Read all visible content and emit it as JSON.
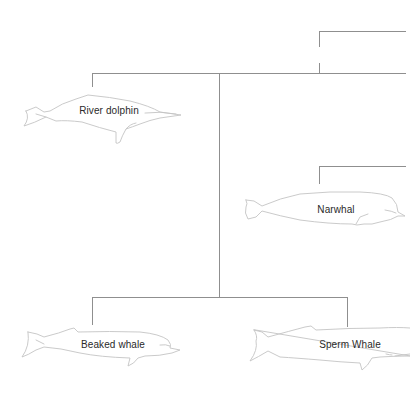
{
  "diagram": {
    "type": "phylogenetic-tree",
    "line_color": "#8f8f8f",
    "outline_color": "#c4c4c4",
    "text_color": "#2a2a2a",
    "taxa": [
      {
        "id": "river-dolphin",
        "label": "River dolphin",
        "label_x": 109,
        "label_y": 111
      },
      {
        "id": "narwhal",
        "label": "Narwhal",
        "label_x": 336,
        "label_y": 210
      },
      {
        "id": "beaked-whale",
        "label": "Beaked whale",
        "label_x": 113,
        "label_y": 345
      },
      {
        "id": "sperm-whale",
        "label": "Sperm Whale",
        "label_x": 350,
        "label_y": 345
      }
    ]
  }
}
